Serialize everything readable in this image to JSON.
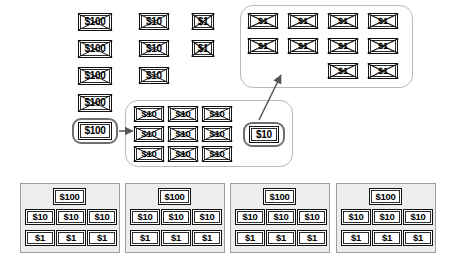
{
  "diagram": {
    "type": "place-value-regrouping",
    "bill_labels": {
      "hundred": "$100",
      "ten": "$10",
      "one": "$1"
    },
    "columns": {
      "hundreds": {
        "name": "hundreds-column",
        "crossed_count": 4,
        "crossed_labels": [
          "$100",
          "$100",
          "$100",
          "$100"
        ],
        "highlighted_label": "$100"
      },
      "tens": {
        "name": "tens-column",
        "crossed_count": 3,
        "crossed_labels": [
          "$10",
          "$10",
          "$10"
        ]
      },
      "ones": {
        "name": "ones-column",
        "crossed_count": 2,
        "crossed_labels": [
          "$1",
          "$1"
        ]
      }
    },
    "regroup_tens_group": {
      "name": "regrouped-tens-group",
      "count": 9,
      "labels": [
        "$10",
        "$10",
        "$10",
        "$10",
        "$10",
        "$10",
        "$10",
        "$10",
        "$10"
      ],
      "highlighted_label": "$10"
    },
    "regroup_ones_group": {
      "name": "regrouped-ones-group",
      "count": 10,
      "rows": [
        [
          "$1",
          "$1",
          "$1",
          "$1"
        ],
        [
          "$1",
          "$1",
          "$1",
          "$1"
        ],
        [
          "$1",
          "$1"
        ]
      ]
    },
    "arrows": [
      {
        "name": "hundred-to-tens-arrow",
        "from": "$100",
        "to": "regrouped-tens-group"
      },
      {
        "name": "ten-to-ones-arrow",
        "from": "$10",
        "to": "regrouped-ones-group"
      }
    ],
    "answer_panels": [
      {
        "name": "answer-panel-1",
        "hundreds": [
          "$100"
        ],
        "tens": [
          "$10",
          "$10",
          "$10"
        ],
        "ones": [
          "$1",
          "$1",
          "$1"
        ]
      },
      {
        "name": "answer-panel-2",
        "hundreds": [
          "$100"
        ],
        "tens": [
          "$10",
          "$10",
          "$10"
        ],
        "ones": [
          "$1",
          "$1",
          "$1"
        ]
      },
      {
        "name": "answer-panel-3",
        "hundreds": [
          "$100"
        ],
        "tens": [
          "$10",
          "$10",
          "$10"
        ],
        "ones": [
          "$1",
          "$1",
          "$1"
        ]
      },
      {
        "name": "answer-panel-4",
        "hundreds": [
          "$100"
        ],
        "tens": [
          "$10",
          "$10",
          "$10"
        ],
        "ones": [
          "$1",
          "$1",
          "$1"
        ]
      }
    ],
    "colors": {
      "bill_border": "#111111",
      "group_border": "#b9b9b9",
      "pill_border": "#6f6f6f",
      "panel_bg": "#ededed",
      "panel_border": "#9d9d9d",
      "arrow": "#555555"
    }
  }
}
